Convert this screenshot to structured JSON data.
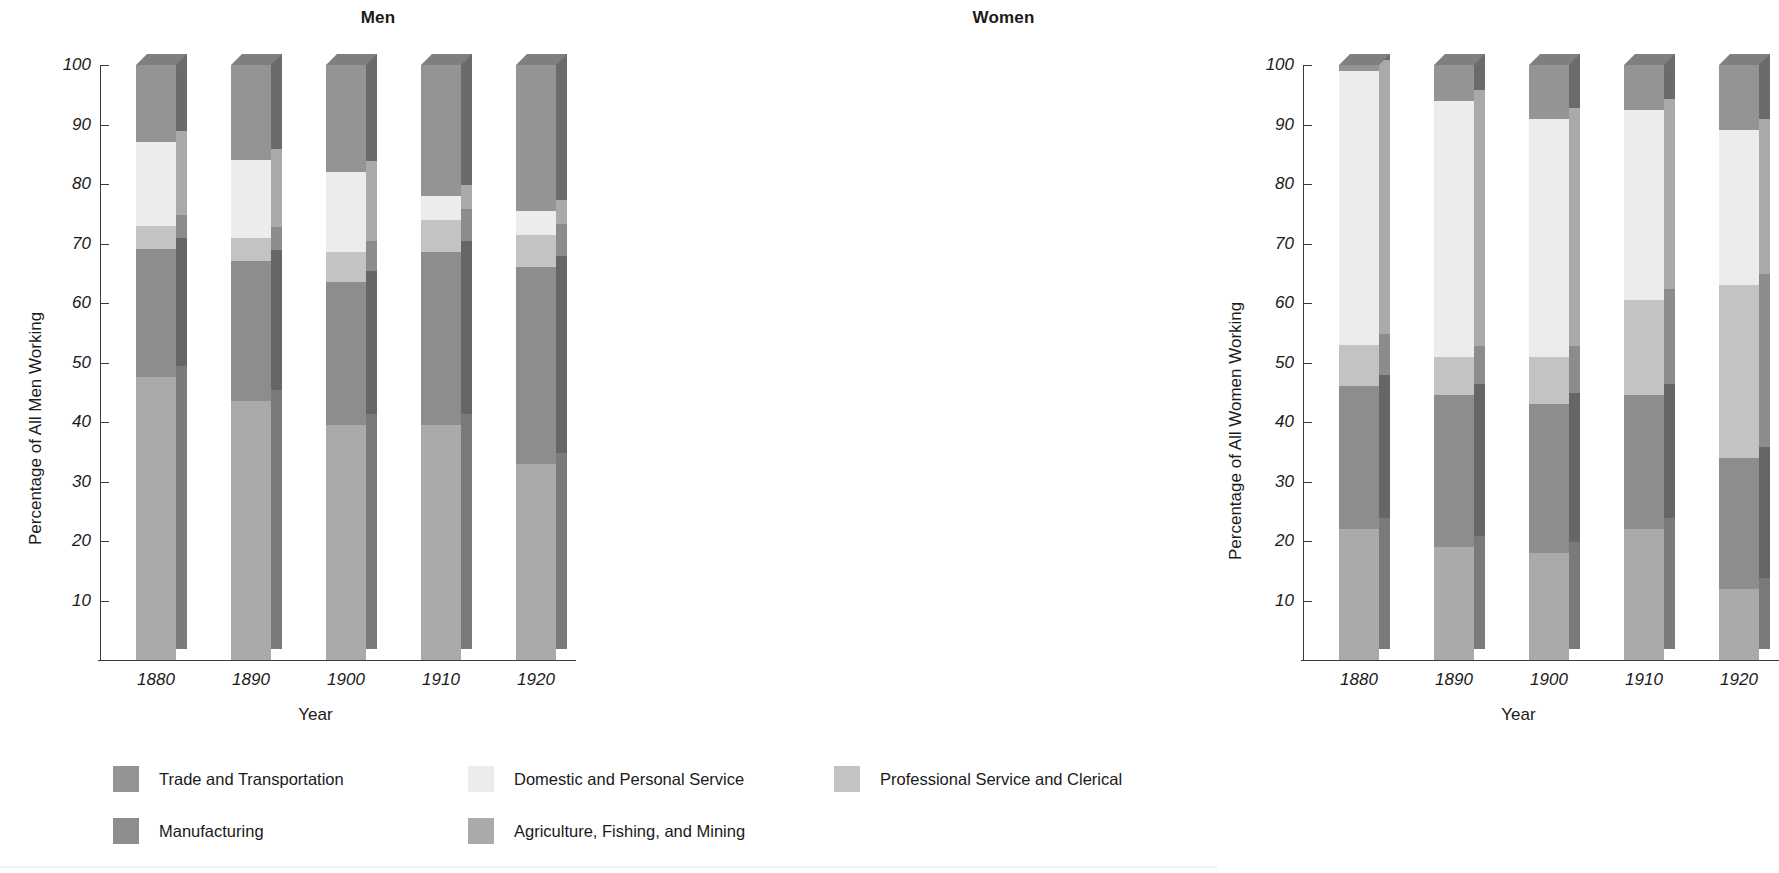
{
  "chart_data": {
    "type": "bar",
    "subtype": "stacked-percentage-3d",
    "panels": [
      {
        "title": "Men",
        "ylabel": "Percentage of All Men Working",
        "xlabel": "Year",
        "categories": [
          "1880",
          "1890",
          "1900",
          "1910",
          "1920"
        ],
        "ylim": [
          0,
          100
        ],
        "yticks": [
          10,
          20,
          30,
          40,
          50,
          60,
          70,
          80,
          90,
          100
        ],
        "grid": false,
        "series": [
          {
            "name": "Agriculture, Fishing, and Mining",
            "values": [
              47.5,
              43.5,
              39.5,
              39.5,
              33.0
            ]
          },
          {
            "name": "Manufacturing",
            "values": [
              21.5,
              23.5,
              24.0,
              29.0,
              33.0
            ]
          },
          {
            "name": "Professional Service and Clerical",
            "values": [
              4.0,
              4.0,
              5.0,
              5.5,
              5.5
            ]
          },
          {
            "name": "Domestic and Personal Service",
            "values": [
              14.0,
              13.0,
              13.5,
              4.0,
              4.0
            ]
          },
          {
            "name": "Trade and Transportation",
            "values": [
              13.0,
              16.0,
              18.0,
              22.0,
              24.5
            ]
          }
        ]
      },
      {
        "title": "Women",
        "ylabel": "Percentage of All Women Working",
        "xlabel": "Year",
        "categories": [
          "1880",
          "1890",
          "1900",
          "1910",
          "1920"
        ],
        "ylim": [
          0,
          100
        ],
        "yticks": [
          10,
          20,
          30,
          40,
          50,
          60,
          70,
          80,
          90,
          100
        ],
        "grid": false,
        "series": [
          {
            "name": "Agriculture, Fishing, and Mining",
            "values": [
              22.0,
              19.0,
              18.0,
              22.0,
              12.0
            ]
          },
          {
            "name": "Manufacturing",
            "values": [
              24.0,
              25.5,
              25.0,
              22.5,
              22.0
            ]
          },
          {
            "name": "Professional Service and Clerical",
            "values": [
              7.0,
              6.5,
              8.0,
              16.0,
              29.0
            ]
          },
          {
            "name": "Domestic and Personal Service",
            "values": [
              46.0,
              43.0,
              40.0,
              32.0,
              26.0
            ]
          },
          {
            "name": "Trade and Transportation",
            "values": [
              1.0,
              6.0,
              9.0,
              7.5,
              11.0
            ]
          }
        ]
      }
    ],
    "legend": {
      "position": "bottom",
      "entries": [
        {
          "label": "Trade and Transportation",
          "color": "#949494"
        },
        {
          "label": "Domestic and Personal Service",
          "color": "#ececec"
        },
        {
          "label": "Professional Service and Clerical",
          "color": "#c3c3c3"
        },
        {
          "label": "Manufacturing",
          "color": "#8d8d8d"
        },
        {
          "label": "Agriculture, Fishing, and Mining",
          "color": "#aaaaaa"
        }
      ]
    },
    "colors": {
      "trade_and_transportation": "#949494",
      "domestic_and_personal_service": "#ececec",
      "professional_service_and_clerical": "#c3c3c3",
      "manufacturing": "#8d8d8d",
      "agriculture_fishing_and_mining": "#aaaaaa",
      "axis": "#3a3a3a",
      "text": "#1a1a1a",
      "background": "#ffffff"
    }
  }
}
